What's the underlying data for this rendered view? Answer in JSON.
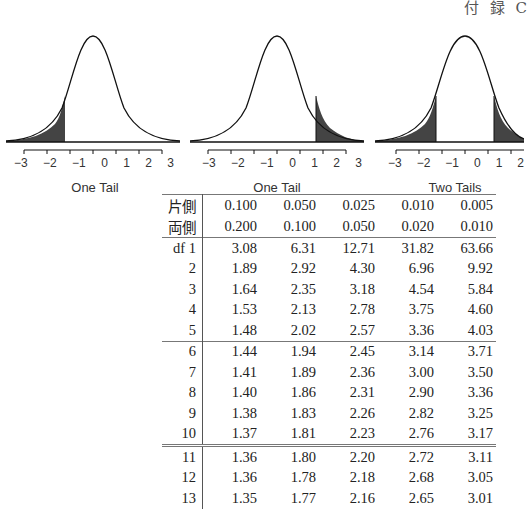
{
  "header": {
    "text": "付 録 C"
  },
  "figures": [
    {
      "caption": "One Tail",
      "shade": "left",
      "ticks": [
        "−3",
        "−2",
        "−1",
        "0",
        "1",
        "2",
        "3"
      ]
    },
    {
      "caption": "One Tail",
      "shade": "right",
      "ticks": [
        "−3",
        "−2",
        "−1",
        "0",
        "1",
        "2",
        "3"
      ]
    },
    {
      "caption": "Two Tails",
      "shade": "both",
      "ticks": [
        "−3",
        "−2",
        "−1",
        "0",
        "1",
        "2"
      ]
    }
  ],
  "table": {
    "header_rows": [
      {
        "label": "片側",
        "values": [
          "0.100",
          "0.050",
          "0.025",
          "0.010",
          "0.005"
        ]
      },
      {
        "label": "両側",
        "values": [
          "0.200",
          "0.100",
          "0.050",
          "0.020",
          "0.010"
        ]
      }
    ],
    "rows": [
      {
        "df": "df 1",
        "values": [
          "3.08",
          "6.31",
          "12.71",
          "31.82",
          "63.66"
        ]
      },
      {
        "df": "2",
        "values": [
          "1.89",
          "2.92",
          "4.30",
          "6.96",
          "9.92"
        ]
      },
      {
        "df": "3",
        "values": [
          "1.64",
          "2.35",
          "3.18",
          "4.54",
          "5.84"
        ]
      },
      {
        "df": "4",
        "values": [
          "1.53",
          "2.13",
          "2.78",
          "3.75",
          "4.60"
        ]
      },
      {
        "df": "5",
        "values": [
          "1.48",
          "2.02",
          "2.57",
          "3.36",
          "4.03"
        ]
      },
      {
        "df": "6",
        "values": [
          "1.44",
          "1.94",
          "2.45",
          "3.14",
          "3.71"
        ]
      },
      {
        "df": "7",
        "values": [
          "1.41",
          "1.89",
          "2.36",
          "3.00",
          "3.50"
        ]
      },
      {
        "df": "8",
        "values": [
          "1.40",
          "1.86",
          "2.31",
          "2.90",
          "3.36"
        ]
      },
      {
        "df": "9",
        "values": [
          "1.38",
          "1.83",
          "2.26",
          "2.82",
          "3.25"
        ]
      },
      {
        "df": "10",
        "values": [
          "1.37",
          "1.81",
          "2.23",
          "2.76",
          "3.17"
        ]
      },
      {
        "df": "11",
        "values": [
          "1.36",
          "1.80",
          "2.20",
          "2.72",
          "3.11"
        ]
      },
      {
        "df": "12",
        "values": [
          "1.36",
          "1.78",
          "2.18",
          "2.68",
          "3.05"
        ]
      },
      {
        "df": "13",
        "values": [
          "1.35",
          "1.77",
          "2.16",
          "2.65",
          "3.01"
        ]
      }
    ]
  }
}
